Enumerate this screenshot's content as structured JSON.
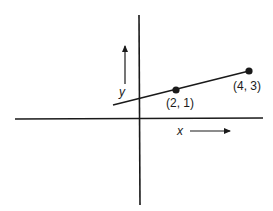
{
  "diagram": {
    "axes": {
      "x_label": "x",
      "y_label": "y"
    },
    "points": [
      {
        "label": "(2, 1)",
        "x": 2,
        "y": 1
      },
      {
        "label": "(4, 3)",
        "x": 4,
        "y": 3
      }
    ],
    "line": {
      "through": [
        "(2, 1)",
        "(4, 3)"
      ]
    },
    "colors": {
      "ink": "#1a1a1a",
      "background": "#ffffff"
    }
  }
}
